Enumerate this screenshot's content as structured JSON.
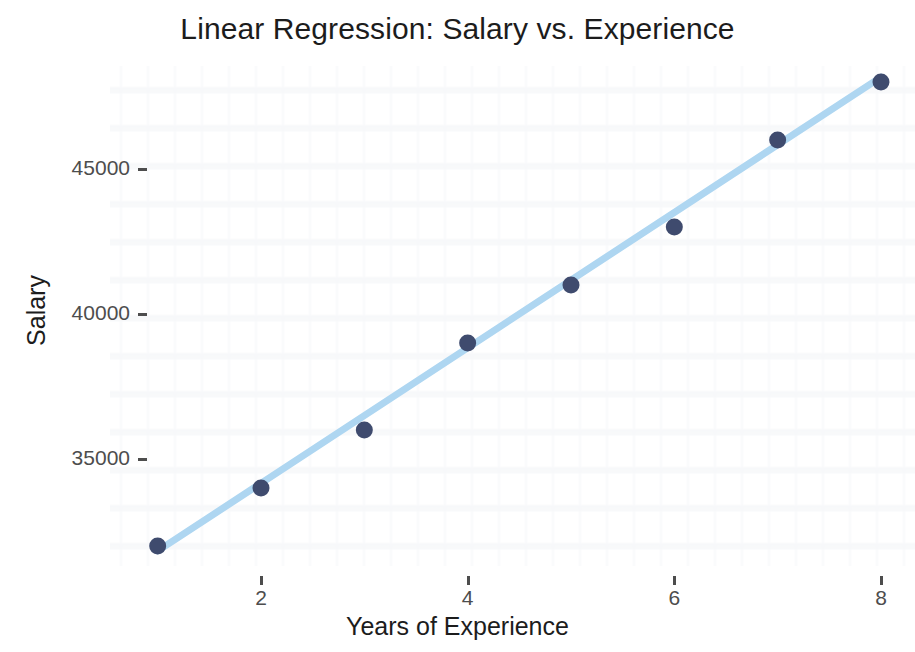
{
  "chart_data": {
    "type": "scatter",
    "title": "Linear Regression: Salary vs. Experience",
    "xlabel": "Years of Experience",
    "ylabel": "Salary",
    "x": [
      1,
      2,
      3,
      4,
      5,
      6,
      7,
      8
    ],
    "values": [
      32000,
      34000,
      36000,
      39000,
      41000,
      43000,
      46000,
      48000
    ],
    "series": [
      {
        "name": "Observed salary",
        "type": "scatter",
        "x": [
          1,
          2,
          3,
          4,
          5,
          6,
          7,
          8
        ],
        "values": [
          32000,
          34000,
          36000,
          39000,
          41000,
          43000,
          46000,
          48000
        ],
        "color": "#3f4b6e"
      },
      {
        "name": "Linear regression fit",
        "type": "line",
        "x": [
          1,
          8
        ],
        "values": [
          31830,
          48170
        ],
        "color": "#aed6f1"
      }
    ],
    "xlim": [
      0.65,
      8.4
    ],
    "ylim": [
      31400,
      48700
    ],
    "xticks": [
      2,
      4,
      6,
      8
    ],
    "xtick_labels": [
      "2",
      "4",
      "6",
      "8"
    ],
    "yticks": [
      35000,
      40000,
      45000
    ],
    "ytick_labels": [
      "35000",
      "40000",
      "45000"
    ],
    "grid": false,
    "legend": "none",
    "background_color": "#ffffff",
    "point_color": "#3f4b6e",
    "line_color": "#aed6f1",
    "tick_color": "#4d4d4d",
    "text_color": "#1c1c1c"
  }
}
